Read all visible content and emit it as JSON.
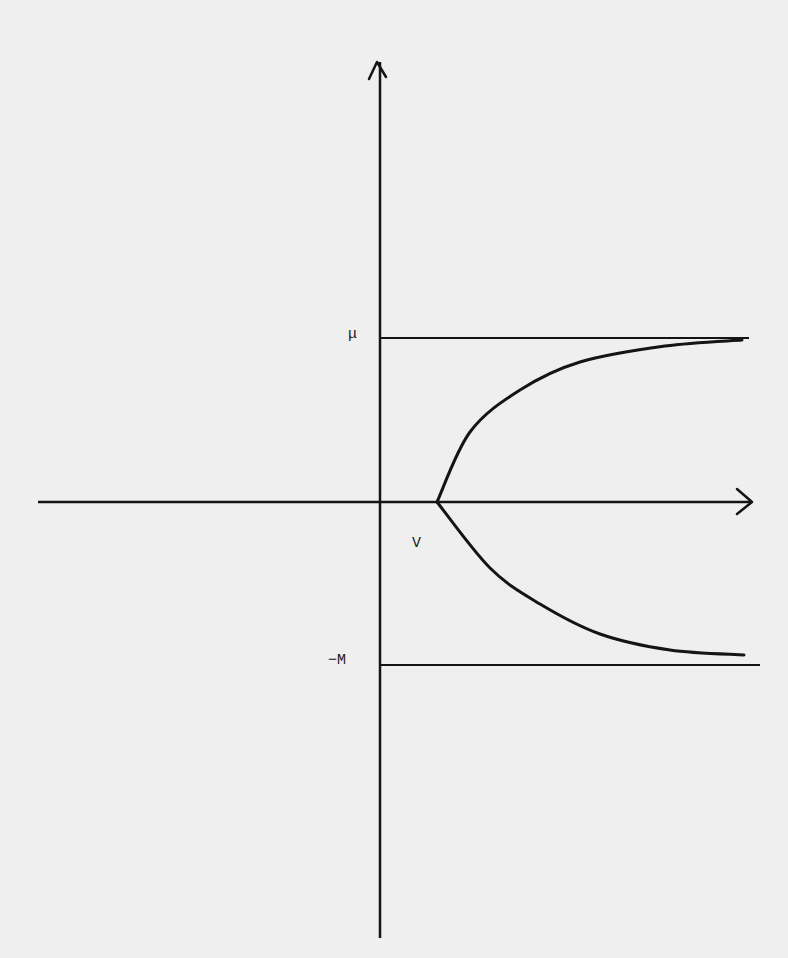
{
  "figure": {
    "type": "phase/bifurcation sketch",
    "background_color": "#efefef",
    "ink_color": "#141414"
  },
  "axes": {
    "origin": {
      "x": 380,
      "y": 502
    },
    "horizontal": {
      "x_start": 38,
      "x_end": 752,
      "arrow": true
    },
    "vertical": {
      "y_top": 62,
      "y_bottom": 938,
      "arrow": true
    }
  },
  "labels": {
    "upper_bound": "μ",
    "lower_bound": "−M",
    "vertex": "V"
  },
  "lines": {
    "upper_bound_line": {
      "y": 338,
      "x_start": 380,
      "x_end": 749
    },
    "lower_bound_line": {
      "y": 665,
      "x_start": 380,
      "x_end": 760
    }
  },
  "curves": {
    "upper_branch": [
      [
        437,
        502
      ],
      [
        470,
        432
      ],
      [
        520,
        390
      ],
      [
        580,
        362
      ],
      [
        665,
        346
      ],
      [
        742,
        340
      ]
    ],
    "lower_branch": [
      [
        437,
        502
      ],
      [
        490,
        568
      ],
      [
        540,
        604
      ],
      [
        600,
        634
      ],
      [
        670,
        650
      ],
      [
        744,
        655
      ]
    ]
  }
}
